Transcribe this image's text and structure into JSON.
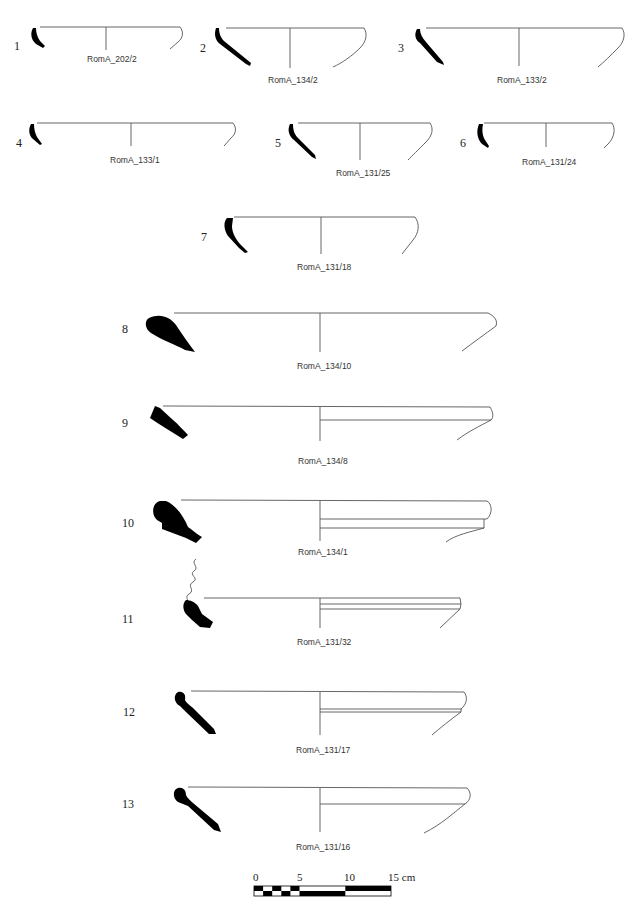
{
  "figure": {
    "type": "archaeological pottery profile plate",
    "items": [
      {
        "number": "1",
        "label": "RomA_202/2"
      },
      {
        "number": "2",
        "label": "RomA_134/2"
      },
      {
        "number": "3",
        "label": "RomA_133/2"
      },
      {
        "number": "4",
        "label": "RomA_133/1"
      },
      {
        "number": "5",
        "label": "RomA_131/25"
      },
      {
        "number": "6",
        "label": "RomA_131/24"
      },
      {
        "number": "7",
        "label": "RomA_131/18"
      },
      {
        "number": "8",
        "label": "RomA_134/10"
      },
      {
        "number": "9",
        "label": "RomA_134/8"
      },
      {
        "number": "10",
        "label": "RomA_134/1"
      },
      {
        "number": "11",
        "label": "RomA_131/32"
      },
      {
        "number": "12",
        "label": "RomA_131/17"
      },
      {
        "number": "13",
        "label": "RomA_131/16"
      }
    ],
    "scale_bar": {
      "ticks": [
        "0",
        "5",
        "10",
        "15 cm"
      ],
      "unit": "cm",
      "length": 15
    }
  }
}
